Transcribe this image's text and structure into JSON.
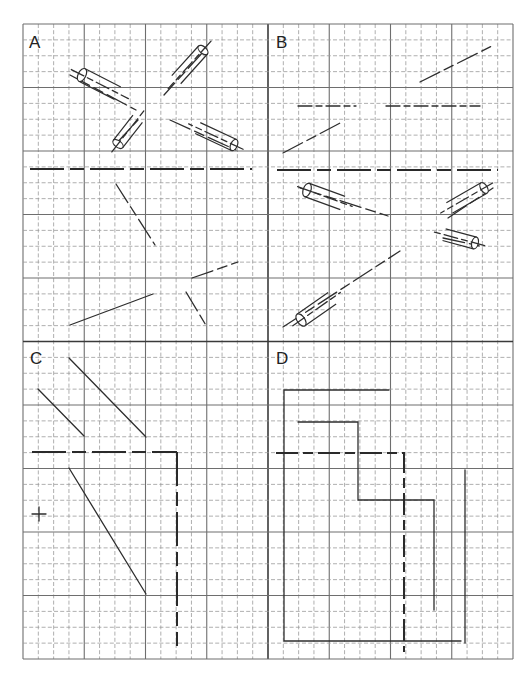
{
  "figure": {
    "background": "#ffffff",
    "grid": {
      "x0": 23,
      "x1": 513,
      "y0": 24,
      "y1": 659,
      "cols": 32,
      "rows": 40,
      "major_every": 4,
      "center_x": 268,
      "center_y": 341
    },
    "panels": [
      {
        "id": "A",
        "label": "A",
        "label_x": 29,
        "label_y": 34
      },
      {
        "id": "B",
        "label": "B",
        "label_x": 276,
        "label_y": 34
      },
      {
        "id": "C",
        "label": "C",
        "label_x": 30,
        "label_y": 350
      },
      {
        "id": "D",
        "label": "D",
        "label_x": 276,
        "label_y": 350
      }
    ],
    "lines": [
      {
        "panel": "A",
        "kind": "thick dash-long",
        "d": "M30 169 L252 169"
      },
      {
        "panel": "A",
        "kind": "ink dash",
        "d": "M70 75 L136 110"
      },
      {
        "panel": "A",
        "kind": "ink dash",
        "d": "M203 52 L164 95"
      },
      {
        "panel": "A",
        "kind": "ink dash",
        "d": "M115 145 L138 120"
      },
      {
        "panel": "A",
        "kind": "ink dash",
        "d": "M170 120 L236 150"
      },
      {
        "panel": "A",
        "kind": "ink dash",
        "d": "M116 184 L155 245"
      },
      {
        "panel": "A",
        "kind": "ink",
        "d": "M70 325 L153 294"
      },
      {
        "panel": "A",
        "kind": "ink dash",
        "d": "M192 278 L238 262"
      },
      {
        "panel": "A",
        "kind": "ink dash",
        "d": "M186 292 L207 327"
      },
      {
        "panel": "B",
        "kind": "thick dash-long",
        "d": "M277 170 L498 170"
      },
      {
        "panel": "B",
        "kind": "ink dash",
        "d": "M283 153 L344 121"
      },
      {
        "panel": "B",
        "kind": "ink dash",
        "d": "M420 82 L494 45"
      },
      {
        "panel": "B",
        "kind": "ink dash-short",
        "d": "M298 106 L356 106"
      },
      {
        "panel": "B",
        "kind": "ink dash-short",
        "d": "M386 106 L480 106"
      },
      {
        "panel": "B",
        "kind": "ink dash",
        "d": "M300 188 L388 216"
      },
      {
        "panel": "B",
        "kind": "ink dash",
        "d": "M448 218 L493 188"
      },
      {
        "panel": "B",
        "kind": "ink dash",
        "d": "M443 238 L480 246"
      },
      {
        "panel": "B",
        "kind": "ink dash",
        "d": "M283 327 L400 251"
      },
      {
        "panel": "C",
        "kind": "ink",
        "d": "M69 358 L146 437"
      },
      {
        "panel": "C",
        "kind": "ink",
        "d": "M38 389 L84 436"
      },
      {
        "panel": "C",
        "kind": "thick dash-long",
        "d": "M32 452 L177 452"
      },
      {
        "panel": "C",
        "kind": "thick dash-long",
        "d": "M177 452 L177 646"
      },
      {
        "panel": "C",
        "kind": "ink",
        "d": "M69 468 L146 594"
      },
      {
        "panel": "C",
        "kind": "ink",
        "d": "M32 514 L46 514 M39 507 L39 521"
      },
      {
        "panel": "D",
        "kind": "ink",
        "d": "M389 390 L284 390 L284 641 L461 641"
      },
      {
        "panel": "D",
        "kind": "ink",
        "d": "M298 422 L358 422 L358 500 L434 500 L434 610"
      },
      {
        "panel": "D",
        "kind": "thick dash",
        "d": "M276 453 L404 453 L404 652"
      },
      {
        "panel": "D",
        "kind": "ink",
        "d": "M465 470 L465 643"
      }
    ],
    "cylinders": [
      {
        "panel": "A",
        "cx": 82,
        "cy": 75,
        "angle": 27,
        "length": 40,
        "radius": 7,
        "tail": 12
      },
      {
        "panel": "A",
        "cx": 203,
        "cy": 50,
        "angle": 132,
        "length": 40,
        "radius": 6,
        "tail": 12
      },
      {
        "panel": "A",
        "cx": 118,
        "cy": 144,
        "angle": -52,
        "length": 32,
        "radius": 6,
        "tail": 10
      },
      {
        "panel": "A",
        "cx": 234,
        "cy": 145,
        "angle": 205,
        "length": 40,
        "radius": 6,
        "tail": 10
      },
      {
        "panel": "B",
        "cx": 307,
        "cy": 190,
        "angle": 20,
        "length": 38,
        "radius": 7,
        "tail": 10
      },
      {
        "panel": "B",
        "cx": 484,
        "cy": 188,
        "angle": 150,
        "length": 40,
        "radius": 6,
        "tail": 10
      },
      {
        "panel": "B",
        "cx": 475,
        "cy": 243,
        "angle": 195,
        "length": 32,
        "radius": 6,
        "tail": 10
      },
      {
        "panel": "B",
        "cx": 301,
        "cy": 320,
        "angle": -35,
        "length": 38,
        "radius": 7,
        "tail": 10
      }
    ]
  }
}
